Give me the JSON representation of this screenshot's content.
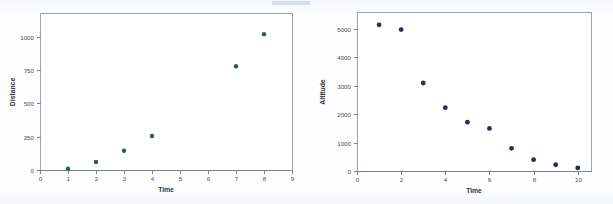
{
  "page": {
    "background_color": "#fdfdfe",
    "artifact_color": "#c9d2e0"
  },
  "charts": [
    {
      "id": "chart-distance",
      "name": "distance-vs-time-scatter",
      "point_color": "#2d5d4e",
      "axis_color": "#7b8291",
      "frame_color": "#9aa3b2"
    },
    {
      "id": "chart-altitude",
      "name": "altitude-vs-time-scatter",
      "point_color": "#2a2a6b",
      "axis_color": "#7b8291",
      "frame_color": "#9aa3b2"
    }
  ],
  "chart_data": [
    {
      "type": "scatter",
      "title": "",
      "xlabel": "Time",
      "ylabel": "Distance",
      "x": [
        1,
        2,
        3,
        4,
        7,
        8
      ],
      "values": [
        10,
        60,
        145,
        255,
        780,
        1020
      ],
      "xlim": [
        0,
        9
      ],
      "ylim": [
        0,
        1180
      ],
      "xticks": [
        0,
        1,
        2,
        3,
        4,
        5,
        6,
        7,
        8,
        9
      ],
      "xticklabels": [
        "0",
        "1",
        "2",
        "3",
        "4",
        "5",
        "6",
        "7",
        "8",
        "9"
      ],
      "yticks": [
        0,
        250,
        500,
        750,
        1000
      ],
      "yticklabels": [
        "0",
        "250",
        "500",
        "750",
        "1000"
      ],
      "grid": false,
      "legend": "none",
      "marker": "filled-circle"
    },
    {
      "type": "scatter",
      "title": "",
      "xlabel": "Time",
      "ylabel": "Altitude",
      "x": [
        1,
        2,
        3,
        4,
        5,
        6,
        7,
        8,
        9,
        10
      ],
      "values": [
        5150,
        4980,
        3100,
        2230,
        1720,
        1500,
        800,
        400,
        220,
        110
      ],
      "xlim": [
        0,
        10.6
      ],
      "ylim": [
        0,
        5600
      ],
      "xticks": [
        0,
        2,
        4,
        6,
        8,
        10
      ],
      "xticklabels": [
        "0",
        "2",
        "4",
        "6",
        "8",
        "10"
      ],
      "yticks": [
        0,
        1000,
        2000,
        3000,
        4000,
        5000
      ],
      "yticklabels": [
        "0",
        "1000",
        "2000",
        "3000",
        "4000",
        "5000"
      ],
      "grid": false,
      "legend": "none",
      "marker": "filled-circle"
    }
  ]
}
